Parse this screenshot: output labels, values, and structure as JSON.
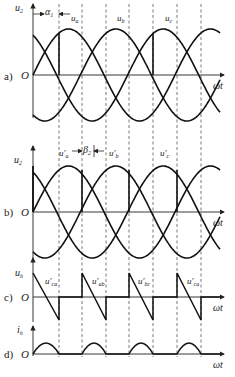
{
  "figure": {
    "panels": [
      {
        "id": "a",
        "panel_label": "a)",
        "origin_label": "O",
        "y_axis_label": "u",
        "y_axis_sub": "2",
        "x_axis_label": "ωt",
        "angle_label": "α",
        "angle_sub": "1",
        "curve_labels": [
          {
            "text": "u",
            "sub": "a"
          },
          {
            "text": "u",
            "sub": "b"
          },
          {
            "text": "u",
            "sub": "c"
          }
        ]
      },
      {
        "id": "b",
        "panel_label": "b)",
        "origin_label": "O",
        "y_axis_label": "u",
        "y_axis_sub": "2",
        "x_axis_label": "ωt",
        "angle_label": "β",
        "angle_sub": "2",
        "curve_labels": [
          {
            "text": "u′",
            "sub": "a"
          },
          {
            "text": "u′",
            "sub": "b"
          },
          {
            "text": "u′",
            "sub": "c"
          }
        ]
      },
      {
        "id": "c",
        "panel_label": "c)",
        "origin_label": "O",
        "y_axis_label": "u",
        "y_axis_sub": "h",
        "x_axis_label": "ωt",
        "curve_labels": [
          {
            "text": "u′",
            "sub": "ca"
          },
          {
            "text": "u′",
            "sub": "ab"
          },
          {
            "text": "u′",
            "sub": "bc"
          },
          {
            "text": "u′",
            "sub": "ca"
          }
        ]
      },
      {
        "id": "d",
        "panel_label": "d)",
        "origin_label": "O",
        "y_axis_label": "i",
        "y_axis_sub": "h",
        "x_axis_label": "ωt"
      }
    ]
  }
}
